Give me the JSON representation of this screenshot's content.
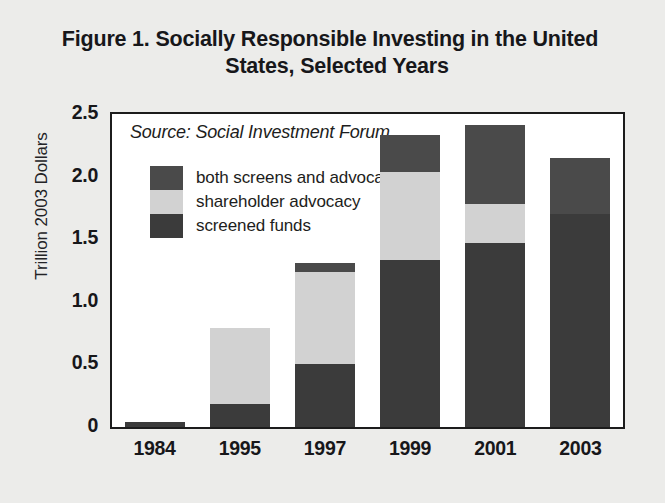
{
  "figure": {
    "title_line_1": "Figure 1. Socially Responsible Investing in the United",
    "title_line_2": "States, Selected Years",
    "source_note": "Source: Social Investment Forum"
  },
  "colors": {
    "page_background": "#ececea",
    "plot_background": "#ffffff",
    "frame": "#1c1c1c",
    "both_screens_and_advocacy": "#4a4a4a",
    "shareholder_advocacy": "#d2d2d2",
    "screened_funds": "#3b3b3b",
    "text": "#17171a"
  },
  "chart_data": {
    "type": "bar",
    "subtype": "stacked",
    "title": "Figure 1. Socially Responsible Investing in the United States, Selected Years",
    "subtitle": "",
    "xlabel": "",
    "ylabel": "Trillion 2003 Dollars",
    "categories": [
      "1984",
      "1995",
      "1997",
      "1999",
      "2001",
      "2003"
    ],
    "series": [
      {
        "name": "screened funds",
        "color": "#3b3b3b",
        "values": [
          0.04,
          0.18,
          0.5,
          1.33,
          1.47,
          1.7
        ]
      },
      {
        "name": "shareholder advocacy",
        "color": "#d2d2d2",
        "values": [
          0.0,
          0.61,
          0.74,
          0.71,
          0.31,
          0.0
        ]
      },
      {
        "name": "both screens and advocacy",
        "color": "#4a4a4a",
        "values": [
          0.0,
          0.0,
          0.07,
          0.29,
          0.63,
          0.45
        ]
      }
    ],
    "totals": [
      0.04,
      0.79,
      1.31,
      2.33,
      2.41,
      2.15
    ],
    "ylim": [
      0,
      2.5
    ],
    "yticks": [
      0,
      0.5,
      1.0,
      1.5,
      2.0,
      2.5
    ],
    "ytick_labels": [
      "0",
      "0.5",
      "1.0",
      "1.5",
      "2.0",
      "2.5"
    ],
    "grid": false,
    "legend_position": "upper-left-inside",
    "legend_entries": [
      "both screens and advocacy",
      "shareholder advocacy",
      "screened funds"
    ],
    "annotations": [
      "Source: Social Investment Forum"
    ]
  }
}
